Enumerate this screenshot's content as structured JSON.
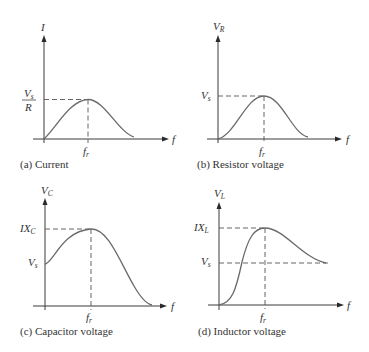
{
  "panels": [
    {
      "id": "a",
      "caption": "(a) Current",
      "y_axis_label": "I",
      "x_axis_label": "f",
      "resonance_label": "f",
      "resonance_sub": "r",
      "level_labels": [
        {
          "num": "V",
          "num_sub": "s",
          "den": "R"
        }
      ]
    },
    {
      "id": "b",
      "caption": "(b) Resistor voltage",
      "y_axis_label": "V",
      "y_axis_sub": "R",
      "x_axis_label": "f",
      "resonance_label": "f",
      "resonance_sub": "r",
      "level_labels": [
        {
          "text": "V",
          "sub": "s"
        }
      ]
    },
    {
      "id": "c",
      "caption": "(c) Capacitor voltage",
      "y_axis_label": "V",
      "y_axis_sub": "C",
      "x_axis_label": "f",
      "resonance_label": "f",
      "resonance_sub": "r",
      "level_labels": [
        {
          "text": "IX",
          "sub": "C"
        },
        {
          "text": "V",
          "sub": "s"
        }
      ]
    },
    {
      "id": "d",
      "caption": "(d) Inductor voltage",
      "y_axis_label": "V",
      "y_axis_sub": "L",
      "x_axis_label": "f",
      "resonance_label": "f",
      "resonance_sub": "r",
      "level_labels": [
        {
          "text": "IX",
          "sub": "L"
        },
        {
          "text": "V",
          "sub": "s"
        }
      ]
    }
  ],
  "colors": {
    "axis": "#3a3a3a",
    "curve": "#6a6a6a",
    "dash": "#555555"
  }
}
